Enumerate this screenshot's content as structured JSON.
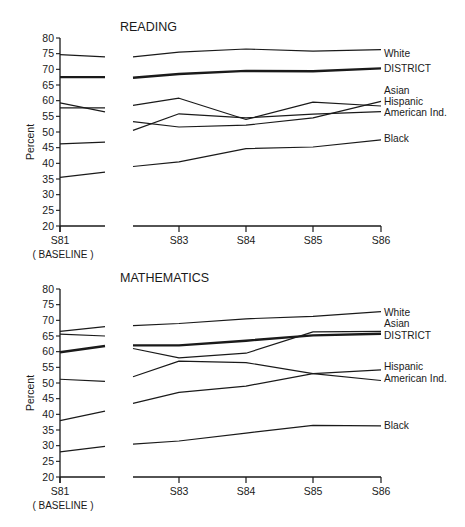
{
  "chart_data": [
    {
      "type": "line",
      "title": "READING",
      "xlabel": "",
      "ylabel": "Percent",
      "ylim": [
        20,
        80
      ],
      "yticks": [
        20,
        25,
        30,
        35,
        40,
        45,
        50,
        55,
        60,
        65,
        70,
        75,
        80
      ],
      "grid": false,
      "x_tick_labels": [
        "S81",
        "S83",
        "S84",
        "S85",
        "S86"
      ],
      "baseline_label": "(BASELINE)",
      "baseline_segment": {
        "x": [
          "S81",
          "S82"
        ],
        "series": [
          {
            "name": "White",
            "values": [
              74.7,
              74.0
            ]
          },
          {
            "name": "DISTRICT",
            "values": [
              67.5,
              67.5
            ],
            "bold": true
          },
          {
            "name": "Asian",
            "values": [
              59.3,
              56.4
            ]
          },
          {
            "name": "American Ind.",
            "values": [
              57.7,
              57.7
            ]
          },
          {
            "name": "Hispanic",
            "values": [
              46.2,
              46.8
            ]
          },
          {
            "name": "Black",
            "values": [
              35.5,
              37.2
            ]
          }
        ]
      },
      "x": [
        "S82",
        "S83",
        "S84",
        "S85",
        "S86"
      ],
      "series": [
        {
          "name": "White",
          "values": [
            74.0,
            75.5,
            76.5,
            75.8,
            76.3
          ]
        },
        {
          "name": "DISTRICT",
          "values": [
            67.3,
            68.5,
            69.5,
            69.4,
            70.3
          ],
          "bold": true
        },
        {
          "name": "Asian",
          "values": [
            58.5,
            60.8,
            54.0,
            59.5,
            58.3
          ]
        },
        {
          "name": "Hispanic",
          "values": [
            53.3,
            51.6,
            52.2,
            54.5,
            59.8
          ]
        },
        {
          "name": "American Ind.",
          "values": [
            50.5,
            55.8,
            54.5,
            55.7,
            56.5
          ]
        },
        {
          "name": "Black",
          "values": [
            39.0,
            40.5,
            44.7,
            45.2,
            47.5
          ]
        }
      ],
      "legend_position": "right-end labels"
    },
    {
      "type": "line",
      "title": "MATHEMATICS",
      "xlabel": "",
      "ylabel": "Percent",
      "ylim": [
        20,
        80
      ],
      "yticks": [
        20,
        25,
        30,
        35,
        40,
        45,
        50,
        55,
        60,
        65,
        70,
        75,
        80
      ],
      "grid": false,
      "x_tick_labels": [
        "S81",
        "S83",
        "S84",
        "S85",
        "S86"
      ],
      "baseline_label": "(BASELINE)",
      "baseline_segment": {
        "x": [
          "S81",
          "S82"
        ],
        "series": [
          {
            "name": "White",
            "values": [
              66.5,
              68.0
            ]
          },
          {
            "name": "Asian",
            "values": [
              65.6,
              65.0
            ]
          },
          {
            "name": "DISTRICT",
            "values": [
              59.8,
              61.8
            ],
            "bold": true
          },
          {
            "name": "American Ind.",
            "values": [
              51.2,
              50.5
            ]
          },
          {
            "name": "Hispanic",
            "values": [
              38.0,
              41.0
            ]
          },
          {
            "name": "Black",
            "values": [
              28.0,
              29.8
            ]
          }
        ]
      },
      "x": [
        "S82",
        "S83",
        "S84",
        "S85",
        "S86"
      ],
      "series": [
        {
          "name": "White",
          "values": [
            68.3,
            69.0,
            70.5,
            71.3,
            72.8
          ]
        },
        {
          "name": "Asian",
          "values": [
            61.0,
            58.0,
            59.5,
            66.3,
            66.5
          ]
        },
        {
          "name": "DISTRICT",
          "values": [
            62.0,
            62.0,
            63.5,
            65.2,
            65.7
          ],
          "bold": true
        },
        {
          "name": "Hispanic",
          "values": [
            43.5,
            47.0,
            49.0,
            53.0,
            54.2
          ]
        },
        {
          "name": "American Ind.",
          "values": [
            52.0,
            57.0,
            56.5,
            53.0,
            50.8
          ]
        },
        {
          "name": "Black",
          "values": [
            30.5,
            31.5,
            34.0,
            36.5,
            36.3
          ]
        }
      ],
      "legend_position": "right-end labels"
    }
  ],
  "labels": {
    "reading_title": "READING",
    "math_title": "MATHEMATICS",
    "ylabel": "Percent",
    "baseline": "( BASELINE )",
    "ticks": [
      "S81",
      "S83",
      "S84",
      "S85",
      "S86"
    ],
    "reading_legend": [
      "White",
      "DISTRICT",
      "Asian",
      "Hispanic",
      "American Ind.",
      "Black"
    ],
    "math_legend": [
      "White",
      "Asian",
      "DISTRICT",
      "Hispanic",
      "American Ind.",
      "Black"
    ]
  }
}
